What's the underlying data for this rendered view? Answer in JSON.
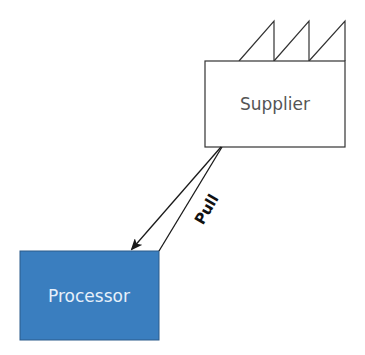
{
  "diagram": {
    "nodes": {
      "supplier": {
        "label": "Supplier",
        "icon": "factory-roof-icon",
        "fill": "#ffffff",
        "stroke": "#333333",
        "text_color": "#555555"
      },
      "processor": {
        "label": "Processor",
        "fill": "#3a7ebf",
        "stroke": "#2a5a8a",
        "text_color": "#e6f0fa"
      }
    },
    "edges": [
      {
        "from": "supplier",
        "to": "processor",
        "label": "Pull",
        "style": "arrow"
      }
    ]
  }
}
